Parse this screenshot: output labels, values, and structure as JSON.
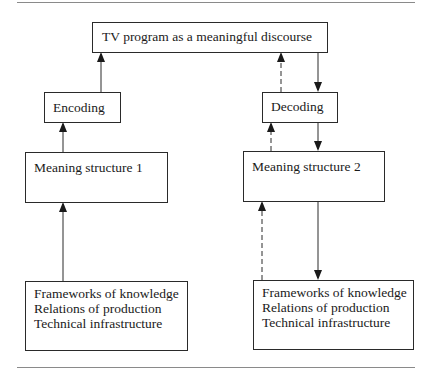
{
  "diagram": {
    "top_box": {
      "label": "TV program as a meaningful discourse"
    },
    "encoding_box": {
      "label": "Encoding"
    },
    "decoding_box": {
      "label": "Decoding"
    },
    "meaning_structure_1": {
      "label": "Meaning structure 1"
    },
    "meaning_structure_2": {
      "label": "Meaning structure 2"
    },
    "infrastructure_left": {
      "lines": [
        "Frameworks of knowledge",
        "Relations of production",
        "Technical infrastructure"
      ]
    },
    "infrastructure_right": {
      "lines": [
        "Frameworks of knowledge",
        "Relations of production",
        "Technical infrastructure"
      ]
    },
    "arrows": [
      {
        "from": "encoding_box",
        "to": "top_box",
        "style": "solid"
      },
      {
        "from": "meaning_structure_1",
        "to": "encoding_box",
        "style": "solid"
      },
      {
        "from": "infrastructure_left",
        "to": "meaning_structure_1",
        "style": "solid"
      },
      {
        "from": "decoding_box",
        "to": "top_box",
        "style": "dashed"
      },
      {
        "from": "top_box",
        "to": "decoding_box",
        "style": "solid"
      },
      {
        "from": "meaning_structure_2",
        "to": "decoding_box",
        "style": "dashed"
      },
      {
        "from": "decoding_box",
        "to": "meaning_structure_2",
        "style": "solid"
      },
      {
        "from": "infrastructure_right",
        "to": "meaning_structure_2",
        "style": "dashed"
      },
      {
        "from": "meaning_structure_2",
        "to": "infrastructure_right",
        "style": "solid"
      }
    ]
  }
}
